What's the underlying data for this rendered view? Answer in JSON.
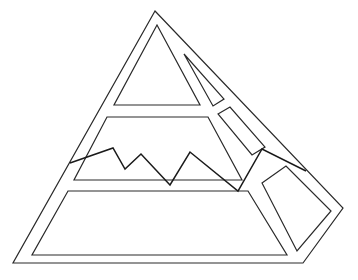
{
  "diagram": {
    "type": "line-art-pyramid",
    "background": "#ffffff",
    "stroke_color": "#2a2a2a",
    "zigzag_color": "#1a1a1a",
    "outer_outline": "155,11 343,208 303,263 13,263",
    "top_triangle": "157,25 200,105 114,105",
    "sliver_triangle": "184,54 224,99 213,106",
    "middle_band": "107,117 208,117 242,180 74,180",
    "right_upper_panel": "218,114 230,107 265,147 252,155",
    "bottom_band": "68,191 248,191 287,255 32,255",
    "right_lower_panel": "262,183 286,166 331,211 297,251",
    "zigzag": "70,163 113,148 125,169 141,154 170,185 190,152 238,191 262,149 306,171"
  }
}
